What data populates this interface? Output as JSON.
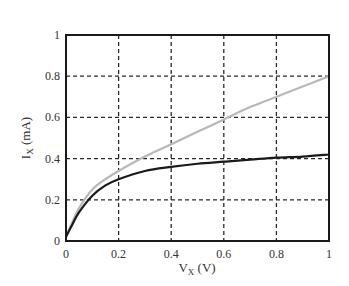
{
  "chart_data": {
    "type": "line",
    "title": "",
    "xlabel": "V_X (V)",
    "xlabel_main": "V",
    "xlabel_sub": "X",
    "xlabel_unit": " (V)",
    "ylabel": "I_X (mA)",
    "ylabel_main": "I",
    "ylabel_sub": "X",
    "ylabel_unit": " (mA)",
    "xlim": [
      0,
      1
    ],
    "ylim": [
      0,
      1
    ],
    "xticks": [
      0,
      0.2,
      0.4,
      0.6,
      0.8,
      1
    ],
    "xtick_labels": [
      "0",
      "0.2",
      "0.4",
      "0.6",
      "0.8",
      "1"
    ],
    "yticks": [
      0,
      0.2,
      0.4,
      0.6,
      0.8,
      1
    ],
    "ytick_labels": [
      "0",
      "0.2",
      "0.4",
      "0.6",
      "0.8",
      "1"
    ],
    "grid": true,
    "grid_style": "dashed",
    "legend": null,
    "series": [
      {
        "name": "gray curve",
        "color": "#b8b8b8",
        "x": [
          0,
          0.02,
          0.05,
          0.1,
          0.15,
          0.2,
          0.3,
          0.4,
          0.5,
          0.6,
          0.7,
          0.8,
          0.9,
          1.0
        ],
        "y": [
          0.02,
          0.08,
          0.16,
          0.25,
          0.3,
          0.34,
          0.41,
          0.47,
          0.53,
          0.59,
          0.65,
          0.7,
          0.75,
          0.8
        ]
      },
      {
        "name": "black curve",
        "color": "#1a1a1a",
        "x": [
          0,
          0.02,
          0.05,
          0.1,
          0.15,
          0.2,
          0.3,
          0.4,
          0.5,
          0.6,
          0.7,
          0.8,
          0.9,
          1.0
        ],
        "y": [
          0.02,
          0.07,
          0.14,
          0.22,
          0.27,
          0.3,
          0.34,
          0.36,
          0.375,
          0.385,
          0.395,
          0.405,
          0.41,
          0.42
        ]
      }
    ]
  }
}
